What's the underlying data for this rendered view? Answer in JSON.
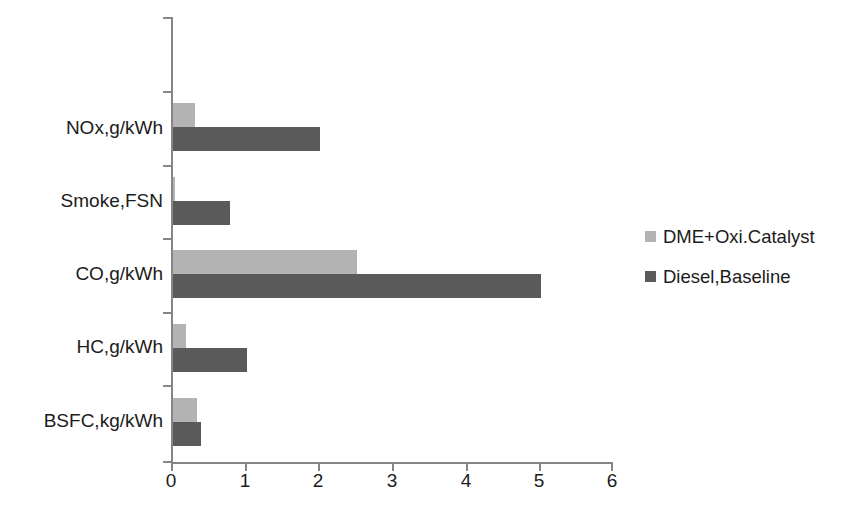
{
  "chart_data": {
    "type": "bar",
    "orientation": "horizontal",
    "title": "",
    "subtitle": "",
    "xlabel": "",
    "ylabel": "",
    "categories": [
      "NOx,g/kWh",
      "Smoke,FSN",
      "CO,g/kWh",
      "HC,g/kWh",
      "BSFC,kg/kWh"
    ],
    "series": [
      {
        "name": "DME+Oxi.Catalyst",
        "color": "#b3b3b3",
        "values": [
          0.3,
          0.03,
          2.5,
          0.17,
          0.33
        ]
      },
      {
        "name": "Diesel,Baseline",
        "color": "#5a5a5a",
        "values": [
          2.0,
          0.78,
          5.0,
          1.0,
          0.38
        ]
      }
    ],
    "xlim": [
      0,
      6
    ],
    "xticks": [
      "0",
      "1",
      "2",
      "3",
      "4",
      "5",
      "6"
    ],
    "grid": false,
    "legend_position": "right",
    "axis_color": "#868686"
  },
  "legend": {
    "items": [
      {
        "label": "DME+Oxi.Catalyst",
        "color": "#b3b3b3"
      },
      {
        "label": "Diesel,Baseline",
        "color": "#5a5a5a"
      }
    ]
  }
}
